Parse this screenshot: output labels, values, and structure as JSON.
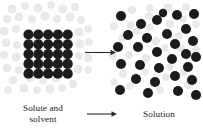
{
  "figure": {
    "background_color": "#ffffff",
    "width": 203,
    "height": 134
  },
  "labels": {
    "left": "Solute and\nsolvent",
    "right": "Solution"
  },
  "colors": {
    "solute": "#1c1c1c",
    "solvent": "#e9e9e9",
    "solvent_stroke": "#e0e0e0",
    "arrow": "#2a2a2a",
    "text": "#1a1a1a"
  },
  "arrows": [
    {
      "name": "reaction-arrow-top",
      "x1": 85,
      "y1": 52.5,
      "x2": 116,
      "y2": 52.5
    },
    {
      "name": "reaction-arrow-bottom",
      "x1": 87,
      "y1": 114,
      "x2": 117,
      "y2": 114
    }
  ],
  "chart_data": {
    "type": "scatter",
    "xlabel": "",
    "ylabel": "",
    "legend": [
      "solute particle",
      "solvent particle"
    ],
    "panels": [
      {
        "name": "solute-and-solvent",
        "caption": "Solute and solvent",
        "lattice": {
          "rows": 5,
          "cols": 5,
          "x0": 28.5,
          "y0": 34.5,
          "spacing": 9.8,
          "radius": 5.1
        },
        "solvent_particles": [
          {
            "x": 12,
            "y": 9,
            "r": 4.0
          },
          {
            "x": 25,
            "y": 6,
            "r": 3.6
          },
          {
            "x": 38,
            "y": 8,
            "r": 4.2
          },
          {
            "x": 51,
            "y": 5,
            "r": 3.5
          },
          {
            "x": 63,
            "y": 9,
            "r": 4.1
          },
          {
            "x": 75,
            "y": 7,
            "r": 3.7
          },
          {
            "x": 7,
            "y": 19,
            "r": 3.8
          },
          {
            "x": 19,
            "y": 17,
            "r": 4.0
          },
          {
            "x": 32,
            "y": 19,
            "r": 3.6
          },
          {
            "x": 45,
            "y": 16,
            "r": 4.2
          },
          {
            "x": 57,
            "y": 19,
            "r": 3.8
          },
          {
            "x": 70,
            "y": 17,
            "r": 4.0
          },
          {
            "x": 81,
            "y": 20,
            "r": 3.6
          },
          {
            "x": 4,
            "y": 31,
            "r": 4.1
          },
          {
            "x": 16,
            "y": 29,
            "r": 3.7
          },
          {
            "x": 79,
            "y": 32,
            "r": 4.0
          },
          {
            "x": 88,
            "y": 29,
            "r": 3.5
          },
          {
            "x": 6,
            "y": 43,
            "r": 3.9
          },
          {
            "x": 17,
            "y": 45,
            "r": 3.6
          },
          {
            "x": 80,
            "y": 44,
            "r": 4.1
          },
          {
            "x": 89,
            "y": 42,
            "r": 3.6
          },
          {
            "x": 4,
            "y": 55,
            "r": 3.8
          },
          {
            "x": 16,
            "y": 57,
            "r": 4.0
          },
          {
            "x": 79,
            "y": 56,
            "r": 3.7
          },
          {
            "x": 88,
            "y": 58,
            "r": 3.9
          },
          {
            "x": 7,
            "y": 68,
            "r": 4.0
          },
          {
            "x": 19,
            "y": 70,
            "r": 3.6
          },
          {
            "x": 30,
            "y": 78,
            "r": 4.1
          },
          {
            "x": 43,
            "y": 80,
            "r": 3.7
          },
          {
            "x": 56,
            "y": 78,
            "r": 4.0
          },
          {
            "x": 68,
            "y": 75,
            "r": 3.6
          },
          {
            "x": 78,
            "y": 69,
            "r": 4.2
          },
          {
            "x": 88,
            "y": 70,
            "r": 3.5
          },
          {
            "x": 13,
            "y": 80,
            "r": 3.8
          },
          {
            "x": 24,
            "y": 88,
            "r": 4.0
          },
          {
            "x": 37,
            "y": 90,
            "r": 3.6
          },
          {
            "x": 50,
            "y": 89,
            "r": 4.1
          },
          {
            "x": 62,
            "y": 88,
            "r": 3.7
          },
          {
            "x": 73,
            "y": 84,
            "r": 3.9
          },
          {
            "x": 8,
            "y": 90,
            "r": 3.6
          },
          {
            "x": 44,
            "y": 69,
            "r": 3.4
          },
          {
            "x": 55,
            "y": 66,
            "r": 3.3
          },
          {
            "x": 30,
            "y": 66,
            "r": 3.2
          },
          {
            "x": 66,
            "y": 60,
            "r": 3.3
          }
        ]
      },
      {
        "name": "solution",
        "caption": "Solution",
        "solute_particles": [
          {
            "x": 121,
            "y": 16,
            "r": 5.0
          },
          {
            "x": 141,
            "y": 24,
            "r": 5.0
          },
          {
            "x": 157,
            "y": 20,
            "r": 5.0
          },
          {
            "x": 177,
            "y": 15,
            "r": 5.0
          },
          {
            "x": 194,
            "y": 14,
            "r": 5.0
          },
          {
            "x": 186,
            "y": 29,
            "r": 5.0
          },
          {
            "x": 167,
            "y": 34,
            "r": 5.0
          },
          {
            "x": 147,
            "y": 38,
            "r": 5.0
          },
          {
            "x": 128,
            "y": 35,
            "r": 5.0
          },
          {
            "x": 193,
            "y": 41,
            "r": 5.0
          },
          {
            "x": 118,
            "y": 47,
            "r": 5.0
          },
          {
            "x": 138,
            "y": 47,
            "r": 5.0
          },
          {
            "x": 175,
            "y": 44,
            "r": 5.0
          },
          {
            "x": 157,
            "y": 52,
            "r": 5.0
          },
          {
            "x": 186,
            "y": 54,
            "r": 5.0
          },
          {
            "x": 172,
            "y": 59,
            "r": 5.0
          },
          {
            "x": 121,
            "y": 64,
            "r": 5.0
          },
          {
            "x": 140,
            "y": 65,
            "r": 5.0
          },
          {
            "x": 159,
            "y": 68,
            "r": 5.0
          },
          {
            "x": 188,
            "y": 67,
            "r": 5.0
          },
          {
            "x": 196,
            "y": 57,
            "r": 5.0
          },
          {
            "x": 136,
            "y": 79,
            "r": 5.0
          },
          {
            "x": 175,
            "y": 76,
            "r": 5.0
          },
          {
            "x": 155,
            "y": 82,
            "r": 5.0
          },
          {
            "x": 192,
            "y": 80,
            "r": 5.0
          },
          {
            "x": 120,
            "y": 90,
            "r": 5.0
          },
          {
            "x": 148,
            "y": 93,
            "r": 5.0
          },
          {
            "x": 178,
            "y": 91,
            "r": 5.0
          },
          {
            "x": 196,
            "y": 95,
            "r": 5.0
          },
          {
            "x": 163,
            "y": 13,
            "r": 4.2
          }
        ],
        "solvent_particles": [
          {
            "x": 132,
            "y": 10,
            "r": 3.8
          },
          {
            "x": 150,
            "y": 8,
            "r": 3.6
          },
          {
            "x": 168,
            "y": 8,
            "r": 4.0
          },
          {
            "x": 186,
            "y": 7,
            "r": 3.6
          },
          {
            "x": 114,
            "y": 26,
            "r": 3.8
          },
          {
            "x": 131,
            "y": 25,
            "r": 3.5
          },
          {
            "x": 149,
            "y": 16,
            "r": 3.6
          },
          {
            "x": 170,
            "y": 24,
            "r": 3.8
          },
          {
            "x": 196,
            "y": 24,
            "r": 3.6
          },
          {
            "x": 122,
            "y": 38,
            "r": 3.5
          },
          {
            "x": 137,
            "y": 31,
            "r": 3.4
          },
          {
            "x": 156,
            "y": 41,
            "r": 3.8
          },
          {
            "x": 179,
            "y": 36,
            "r": 3.5
          },
          {
            "x": 113,
            "y": 56,
            "r": 3.7
          },
          {
            "x": 129,
            "y": 55,
            "r": 3.6
          },
          {
            "x": 146,
            "y": 58,
            "r": 3.8
          },
          {
            "x": 165,
            "y": 48,
            "r": 3.4
          },
          {
            "x": 181,
            "y": 48,
            "r": 3.6
          },
          {
            "x": 196,
            "y": 50,
            "r": 3.5
          },
          {
            "x": 123,
            "y": 74,
            "r": 3.7
          },
          {
            "x": 145,
            "y": 72,
            "r": 3.5
          },
          {
            "x": 166,
            "y": 77,
            "r": 3.6
          },
          {
            "x": 184,
            "y": 72,
            "r": 3.8
          },
          {
            "x": 130,
            "y": 86,
            "r": 3.6
          },
          {
            "x": 160,
            "y": 90,
            "r": 3.5
          },
          {
            "x": 188,
            "y": 85,
            "r": 3.7
          },
          {
            "x": 114,
            "y": 82,
            "r": 3.4
          },
          {
            "x": 170,
            "y": 67,
            "r": 3.2
          },
          {
            "x": 150,
            "y": 27,
            "r": 3.2
          },
          {
            "x": 183,
            "y": 19,
            "r": 3.3
          }
        ]
      }
    ]
  }
}
